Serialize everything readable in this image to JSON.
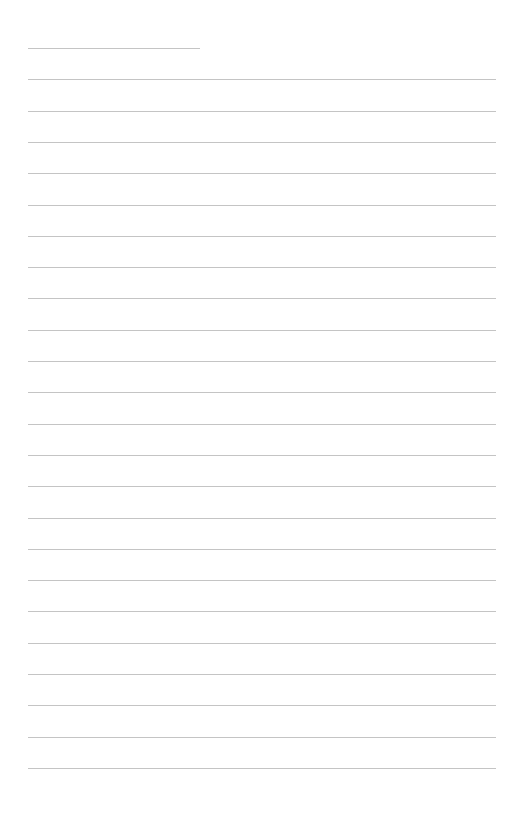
{
  "page": {
    "type": "lined-paper",
    "line_count": 24,
    "line_color": "#c4c4c4",
    "lines": []
  }
}
